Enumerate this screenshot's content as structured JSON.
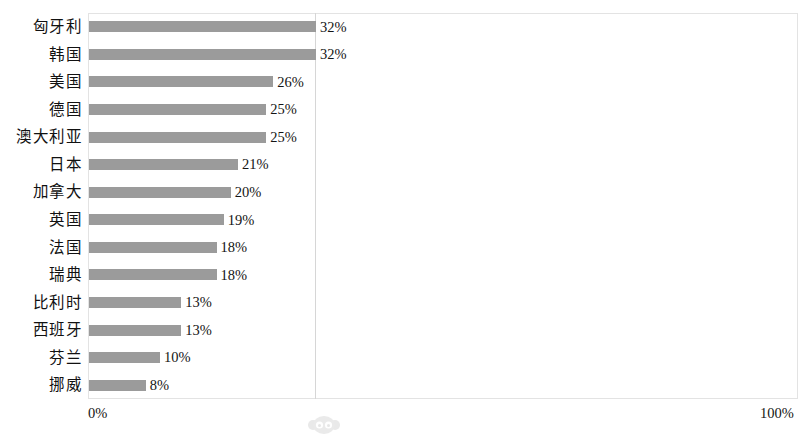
{
  "chart_data": {
    "type": "bar",
    "orientation": "horizontal",
    "title": "",
    "subtitle": "",
    "xlabel": "",
    "ylabel": "",
    "xlim": [
      0,
      100
    ],
    "x_tick_labels": [
      "0%",
      "100%"
    ],
    "grid": true,
    "gridlines_x": [
      32
    ],
    "legend": null,
    "value_label_suffix": "%",
    "categories": [
      "匈牙利",
      "韩国",
      "美国",
      "德国",
      "澳大利亚",
      "日本",
      "加拿大",
      "英国",
      "法国",
      "瑞典",
      "比利时",
      "西班牙",
      "芬兰",
      "挪威"
    ],
    "values": [
      32,
      32,
      26,
      25,
      25,
      21,
      20,
      19,
      18,
      18,
      13,
      13,
      10,
      8
    ],
    "value_labels": [
      "32%",
      "32%",
      "26%",
      "25%",
      "25%",
      "21%",
      "20%",
      "19%",
      "18%",
      "18%",
      "13%",
      "13%",
      "10%",
      "8%"
    ],
    "series": [
      {
        "name": "",
        "values": [
          32,
          32,
          26,
          25,
          25,
          21,
          20,
          19,
          18,
          18,
          13,
          13,
          10,
          8
        ]
      }
    ],
    "colors": {
      "bar": "#9b9b9b",
      "background": "#ffffff",
      "plot_border": "#e3e3e3",
      "gridline": "#d6d6d6",
      "text": "#141414"
    }
  },
  "axis": {
    "min_label": "0%",
    "max_label": "100%"
  },
  "watermark": {
    "name": "monkey-face-watermark"
  }
}
